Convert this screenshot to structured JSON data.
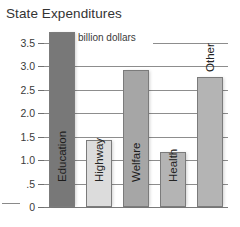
{
  "chart": {
    "title": "State Expenditures",
    "subtitle": "billion dollars"
  },
  "chart_data": {
    "type": "bar",
    "title": "State Expenditures",
    "subtitle": "billion dollars",
    "xlabel": "",
    "ylabel": "billion dollars",
    "ylim": [
      0,
      3.9
    ],
    "yticks": [
      0,
      0.5,
      1.0,
      1.5,
      2.0,
      2.5,
      3.0,
      3.5
    ],
    "ytick_labels": [
      "0",
      ".5",
      "1.0",
      "1.5",
      "2.0",
      "2.5",
      "3.0",
      "3.5"
    ],
    "grid": true,
    "legend": false,
    "categories": [
      "Education",
      "Highway",
      "Welfare",
      "Health",
      "Other"
    ],
    "values": [
      3.72,
      1.42,
      2.93,
      1.17,
      2.78
    ],
    "colors": [
      "#787878",
      "#dcdcdc",
      "#a6a6a6",
      "#b4b4b4",
      "#b4b4b4"
    ],
    "label_positions": [
      "inside",
      "inside",
      "inside",
      "inside",
      "outside"
    ]
  },
  "colors": {
    "dark_bar": "#787878",
    "light_bar": "#dcdcdc",
    "mid_bar": "#b4b4b4",
    "welfare_bar": "#a6a6a6",
    "gridline": "#8d8d8d",
    "text": "#2b2b2b",
    "background": "#ffffff"
  }
}
